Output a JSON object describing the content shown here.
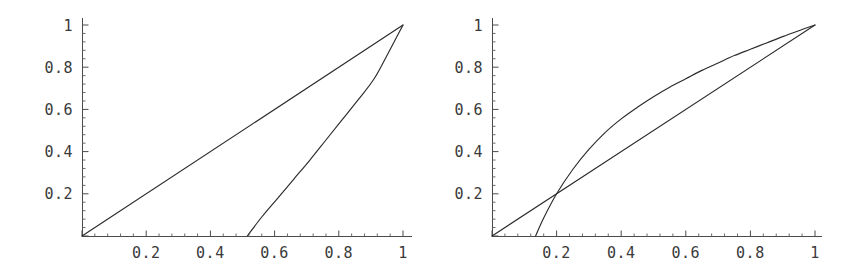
{
  "figure": {
    "background": "#ffffff",
    "curve_color": "#2b2b2b",
    "axis_color": "#4a4a4a",
    "label_color": "#3a3a3a"
  },
  "chart_data": [
    {
      "type": "line",
      "title": "",
      "subtitle": "",
      "xlabel": "",
      "ylabel": "",
      "panel": "left",
      "xlim": [
        0,
        1.02
      ],
      "ylim": [
        0,
        1.02
      ],
      "grid": false,
      "legend": "none",
      "xticks": [
        0.2,
        0.4,
        0.6,
        0.8,
        1
      ],
      "xtick_labels": [
        "0.2",
        "0.4",
        "0.6",
        "0.8",
        "1"
      ],
      "yticks": [
        0.2,
        0.4,
        0.6,
        0.8,
        1
      ],
      "ytick_labels": [
        "0.2",
        "0.4",
        "0.6",
        "0.8",
        "1"
      ],
      "minor_ticks_per_interval": 4,
      "series": [
        {
          "name": "diagonal",
          "x": [
            0,
            1
          ],
          "values": [
            0,
            1
          ]
        },
        {
          "name": "lower-branch",
          "x": [
            0.515,
            0.56,
            0.61,
            0.66,
            0.71,
            0.76,
            0.81,
            0.86,
            0.91,
            0.955,
            1.0
          ],
          "values": [
            0.0,
            0.09,
            0.18,
            0.27,
            0.36,
            0.455,
            0.55,
            0.645,
            0.745,
            0.87,
            1.0
          ]
        }
      ]
    },
    {
      "type": "line",
      "title": "",
      "subtitle": "",
      "xlabel": "",
      "ylabel": "",
      "panel": "right",
      "xlim": [
        0,
        1.02
      ],
      "ylim": [
        0,
        1.02
      ],
      "grid": false,
      "legend": "none",
      "xticks": [
        0.2,
        0.4,
        0.6,
        0.8,
        1
      ],
      "xtick_labels": [
        "0.2",
        "0.4",
        "0.6",
        "0.8",
        "1"
      ],
      "yticks": [
        0.2,
        0.4,
        0.6,
        0.8,
        1
      ],
      "ytick_labels": [
        "0.2",
        "0.4",
        "0.6",
        "0.8",
        "1"
      ],
      "minor_ticks_per_interval": 4,
      "series": [
        {
          "name": "diagonal",
          "x": [
            0,
            1
          ],
          "values": [
            0,
            1
          ]
        },
        {
          "name": "upper-branch",
          "x": [
            0.135,
            0.16,
            0.2,
            0.25,
            0.3,
            0.35,
            0.4,
            0.45,
            0.5,
            0.55,
            0.6,
            0.65,
            0.7,
            0.75,
            0.8,
            0.85,
            0.9,
            0.95,
            1.0
          ],
          "values": [
            0.0,
            0.085,
            0.2,
            0.315,
            0.41,
            0.49,
            0.555,
            0.61,
            0.66,
            0.705,
            0.745,
            0.785,
            0.82,
            0.855,
            0.885,
            0.915,
            0.945,
            0.973,
            1.0
          ]
        }
      ]
    }
  ]
}
